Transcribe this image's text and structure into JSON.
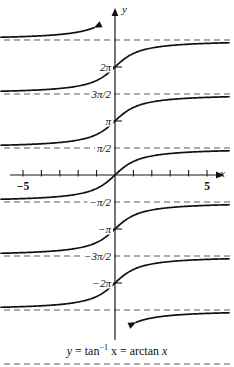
{
  "figure": {
    "caption_lhs": "y",
    "caption_eq1": " = tan",
    "caption_exp": "−1",
    "caption_mid": " x = arctan ",
    "caption_var": "x",
    "caption_plain": "y = tan−1 x = arctan x"
  },
  "axes": {
    "x_axis_label": "x",
    "y_axis_label": "y",
    "x_tick_labels": [
      {
        "text": "−5",
        "value": -5
      },
      {
        "text": "5",
        "value": 5
      }
    ],
    "y_tick_labels": [
      {
        "text": "2π",
        "value": 6.2832
      },
      {
        "text": "3π/2",
        "value": 4.7124
      },
      {
        "text": "π",
        "value": 3.1416
      },
      {
        "text": "π/2",
        "value": 1.5708
      },
      {
        "text": "−π/2",
        "value": -1.5708
      },
      {
        "text": "−π",
        "value": -3.1416
      },
      {
        "text": "−3π/2",
        "value": -4.7124
      },
      {
        "text": "−2π",
        "value": -6.2832
      }
    ]
  },
  "colors": {
    "curve": "#111111",
    "axis": "#1a1a1a",
    "asymptote": "#5a5a5a",
    "background": "#ffffff"
  },
  "chart_data": {
    "type": "line",
    "title": "y = tan−1 x = arctan x",
    "xlabel": "x",
    "ylabel": "y",
    "xlim": [
      -6.2,
      6.2
    ],
    "ylim": [
      -11.0,
      11.0
    ],
    "grid": false,
    "legend": "none",
    "x_ticks": [
      -5,
      -4,
      -3,
      -2,
      -1,
      1,
      2,
      3,
      4,
      5
    ],
    "x_tick_labels_shown": [
      "−5",
      "5"
    ],
    "y_tick_marks": [
      6.2832,
      3.1416,
      -3.1416,
      -6.2832
    ],
    "y_tick_labels_shown": [
      "2π",
      "3π/2",
      "π",
      "π/2",
      "−π/2",
      "−π",
      "−3π/2",
      "−2π"
    ],
    "asymptotes": [
      {
        "y": 10.9956,
        "label": "7π/2",
        "labeled": false
      },
      {
        "y": 7.854,
        "label": "5π/2",
        "labeled": false
      },
      {
        "y": 4.7124,
        "label": "3π/2",
        "labeled": true
      },
      {
        "y": 1.5708,
        "label": "π/2",
        "labeled": true
      },
      {
        "y": -1.5708,
        "label": "−π/2",
        "labeled": true
      },
      {
        "y": -4.7124,
        "label": "−3π/2",
        "labeled": true
      },
      {
        "y": -7.854,
        "label": "−5π/2",
        "labeled": false
      },
      {
        "y": -10.9956,
        "label": "−7π/2",
        "labeled": false
      }
    ],
    "series": [
      {
        "name": "branch k=3",
        "offset": 9.4248,
        "formula": "arctan(x) + 3π",
        "partial": true,
        "arrow": "up-left-end"
      },
      {
        "name": "branch k=2",
        "offset": 6.2832,
        "formula": "arctan(x) + 2π",
        "partial": false,
        "y_intercept": 6.2832
      },
      {
        "name": "branch k=1",
        "offset": 3.1416,
        "formula": "arctan(x) + π",
        "partial": false,
        "y_intercept": 3.1416
      },
      {
        "name": "branch k=0",
        "offset": 0,
        "formula": "arctan(x)",
        "partial": false,
        "y_intercept": 0
      },
      {
        "name": "branch k=-1",
        "offset": -3.1416,
        "formula": "arctan(x) − π",
        "partial": false,
        "y_intercept": -3.1416
      },
      {
        "name": "branch k=-2",
        "offset": -6.2832,
        "formula": "arctan(x) − 2π",
        "partial": false,
        "y_intercept": -6.2832
      },
      {
        "name": "branch k=-3",
        "offset": -9.4248,
        "formula": "arctan(x) − 3π",
        "partial": true,
        "arrow": "down-right-end"
      }
    ]
  },
  "geometry": {
    "origin_x": 115,
    "origin_y": 175,
    "px_per_unit_y": 17.19,
    "px_per_unit_x": 18.4
  }
}
